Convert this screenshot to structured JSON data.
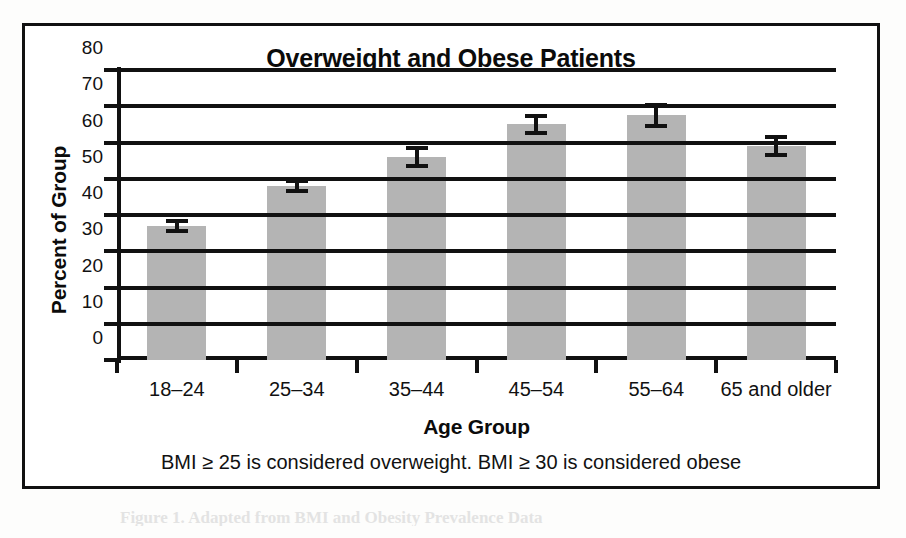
{
  "chart_data": {
    "type": "bar",
    "title": "Overweight and Obese Patients",
    "xlabel": "Age Group",
    "ylabel": "Percent of Group",
    "caption": "BMI ≥ 25 is considered overweight. BMI ≥ 30 is considered obese",
    "categories": [
      "18–24",
      "25–34",
      "35–44",
      "45–54",
      "55–64",
      "65 and older"
    ],
    "values": [
      37,
      48,
      56,
      65,
      67.5,
      59
    ],
    "errors": [
      2,
      2,
      3,
      3,
      3.5,
      3
    ],
    "series": [
      {
        "name": "Percent of Group",
        "values": [
          37,
          48,
          56,
          65,
          67.5,
          59
        ]
      }
    ],
    "ylim": [
      0,
      80
    ],
    "yticks": [
      0,
      10,
      20,
      30,
      40,
      50,
      60,
      70,
      80
    ],
    "ytick_labels": [
      "0",
      "10",
      "20",
      "30",
      "40",
      "50",
      "60",
      "70",
      "80"
    ],
    "grid": true,
    "legend": false,
    "bar_color": "#b4b4b4",
    "axis_color": "#111111"
  },
  "figure": {
    "page_remnant": "Figure 1. Adapted from BMI and Obesity Prevalence Data"
  }
}
